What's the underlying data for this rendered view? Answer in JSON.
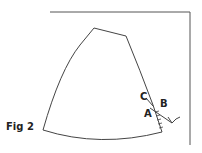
{
  "figure": {
    "caption": "Fig 2",
    "labels": {
      "a": "A",
      "b": "B",
      "c": "C"
    },
    "stroke_color": "#444444"
  }
}
